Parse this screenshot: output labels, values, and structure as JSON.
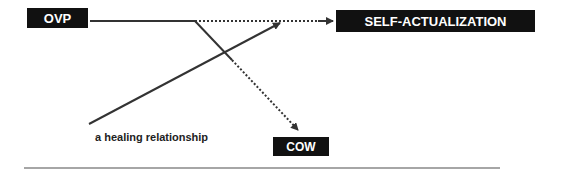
{
  "nodes": {
    "ovp": "OVP",
    "self_actualization": "SELF-ACTUALIZATION",
    "cow": "COW"
  },
  "labels": {
    "healing": "a healing relationship"
  },
  "colors": {
    "box_bg": "#111111",
    "line": "#333333"
  }
}
